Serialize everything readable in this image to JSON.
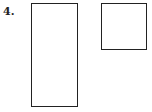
{
  "problem": {
    "number_label": "4.",
    "shapes": [
      {
        "type": "rectangle",
        "orientation": "tall"
      },
      {
        "type": "square"
      }
    ]
  }
}
